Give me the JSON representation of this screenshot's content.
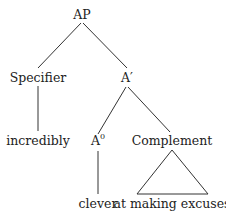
{
  "diagram": {
    "type": "syntax-tree",
    "nodes": {
      "root": "AP",
      "specifier": "Specifier",
      "a_bar": "A′",
      "specifier_word": "incredibly",
      "head_base": "A",
      "head_sup": "0",
      "complement": "Complement",
      "head_word": "clever",
      "complement_phrase": "at making excuses"
    },
    "edges": [
      [
        "AP",
        "Specifier"
      ],
      [
        "AP",
        "A′"
      ],
      [
        "Specifier",
        "incredibly"
      ],
      [
        "A′",
        "A0"
      ],
      [
        "A′",
        "Complement"
      ],
      [
        "A0",
        "clever"
      ],
      [
        "Complement",
        "at making excuses (triangle)"
      ]
    ],
    "colors": {
      "line": "#333333",
      "text": "#222222",
      "background": "#ffffff"
    }
  }
}
